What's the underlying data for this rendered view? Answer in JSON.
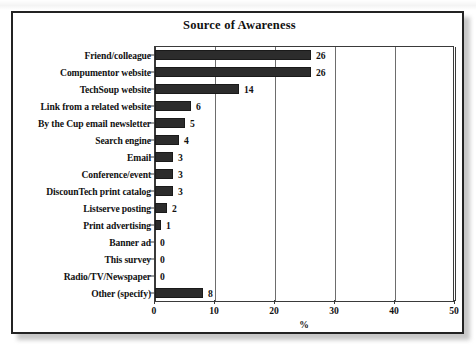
{
  "figure": {
    "title": "Source of Awareness",
    "frame_color": "#232323",
    "bar_color": "#2c2c2c",
    "grid_color": "#6d6d6d"
  },
  "chart_data": {
    "type": "bar",
    "orientation": "horizontal",
    "title": "Source of Awareness",
    "xlabel": "%",
    "ylabel": "",
    "xlim": [
      0,
      50
    ],
    "xticks": [
      0,
      10,
      20,
      30,
      40,
      50
    ],
    "xtick_labels": [
      "0",
      "10",
      "20",
      "30",
      "40",
      "50"
    ],
    "grid": true,
    "legend": false,
    "categories": [
      "Friend/colleague",
      "Compumentor website",
      "TechSoup website",
      "Link from a related website",
      "By the Cup email newsletter",
      "Search engine",
      "Email",
      "Conference/event",
      "DiscounTech print catalog",
      "Listserve posting",
      "Print advertising",
      "Banner ad",
      "This survey",
      "Radio/TV/Newspaper",
      "Other (specify)"
    ],
    "values": [
      26,
      26,
      14,
      6,
      5,
      4,
      3,
      3,
      3,
      2,
      1,
      0,
      0,
      0,
      8
    ],
    "value_labels": [
      "26",
      "26",
      "14",
      "6",
      "5",
      "4",
      "3",
      "3",
      "3",
      "2",
      "1",
      "0",
      "0",
      "0",
      "8"
    ]
  }
}
